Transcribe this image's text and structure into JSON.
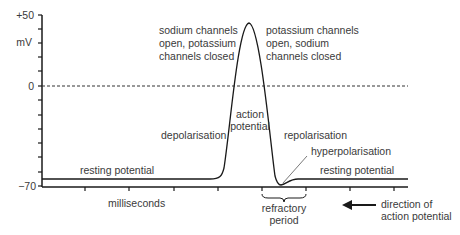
{
  "diagram": {
    "title": "Action potential",
    "y_axis": {
      "top_label": "+50",
      "unit_label": "mV",
      "zero_label": "0",
      "bottom_label": "−70",
      "range": [
        -70,
        50
      ]
    },
    "x_axis": {
      "label": "milliseconds"
    },
    "annotations": {
      "sodium_open": [
        "sodium channels",
        "open, potassium",
        "channels closed"
      ],
      "potassium_open": [
        "potassium channels",
        "open, sodium",
        "channels closed"
      ],
      "action_potential": [
        "action",
        "potential"
      ],
      "depolarisation": "depolarisation",
      "repolarisation": "repolarisation",
      "hyperpolarisation": "hyperpolarisation",
      "resting_left": "resting potential",
      "resting_right": "resting potential",
      "refractory": [
        "refractory",
        "period"
      ],
      "direction": [
        "direction of",
        "action potential"
      ]
    },
    "colors": {
      "line": "#1a1a1a",
      "text": "#3a3a3a",
      "background": "#ffffff"
    }
  }
}
